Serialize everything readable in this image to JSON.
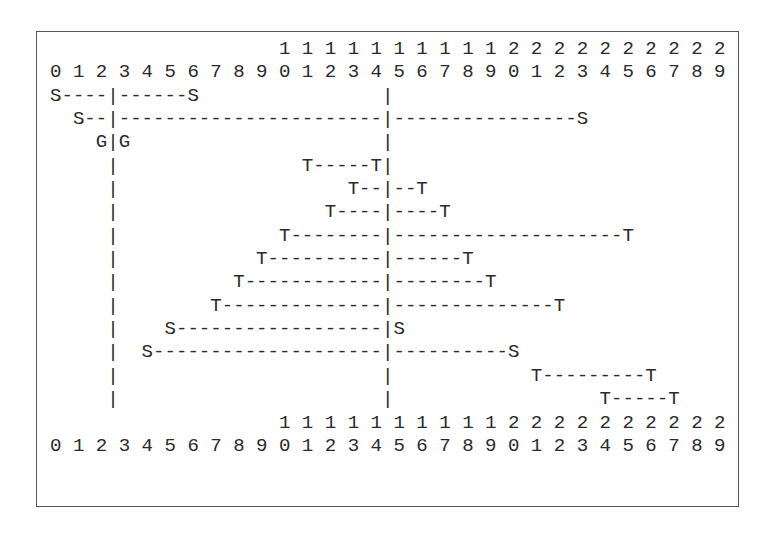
{
  "diagram": {
    "type": "ascii-interval-timeline",
    "header": {
      "tens_row": "                    1 1 1 1 1 1 1 1 1 1 2 2 2 2 2 2 2 2 2 2",
      "units_row": "0 1 2 3 4 5 6 7 8 9 0 1 2 3 4 5 6 7 8 9 0 1 2 3 4 5 6 7 8 9"
    },
    "rows": [
      "S----|------S                |",
      "  S--|-----------------------|----------------S",
      "    G|G                      |",
      "     |                T-----T|",
      "     |                    T--|--T",
      "     |                  T----|----T",
      "     |              T--------|--------------------T",
      "     |            T----------|------T",
      "     |          T------------|--------T",
      "     |        T--------------|--------------T",
      "     |    S------------------|S",
      "     |  S--------------------|----------S",
      "     |                       |            T---------T",
      "     |                       |                  T-----T"
    ],
    "footer": {
      "tens_row": "                    1 1 1 1 1 1 1 1 1 1 2 2 2 2 2 2 2 2 2 2",
      "units_row": "0 1 2 3 4 5 6 7 8 9 0 1 2 3 4 5 6 7 8 9 0 1 2 3 4 5 6 7 8 9"
    },
    "intervals": [
      {
        "label": "S",
        "start": 0,
        "end": 6
      },
      {
        "label": "S",
        "start": 1,
        "end": 23
      },
      {
        "label": "G",
        "start": 2,
        "end": 3
      },
      {
        "label": "T",
        "start": 11,
        "end": 14
      },
      {
        "label": "T",
        "start": 13,
        "end": 16
      },
      {
        "label": "T",
        "start": 12,
        "end": 17
      },
      {
        "label": "T",
        "start": 10,
        "end": 25
      },
      {
        "label": "T",
        "start": 9,
        "end": 18
      },
      {
        "label": "T",
        "start": 8,
        "end": 19
      },
      {
        "label": "T",
        "start": 7,
        "end": 22
      },
      {
        "label": "S",
        "start": 5,
        "end": 15
      },
      {
        "label": "S",
        "start": 4,
        "end": 20
      },
      {
        "label": "T",
        "start": 21,
        "end": 26
      },
      {
        "label": "T",
        "start": 24,
        "end": 27
      }
    ],
    "markers": [
      {
        "name": "left-boundary",
        "between": [
          2,
          3
        ]
      },
      {
        "name": "right-boundary",
        "between": [
          14,
          15
        ]
      }
    ],
    "colors": {
      "text": "#2a2a2a",
      "border": "#555555",
      "background": "#ffffff"
    }
  }
}
